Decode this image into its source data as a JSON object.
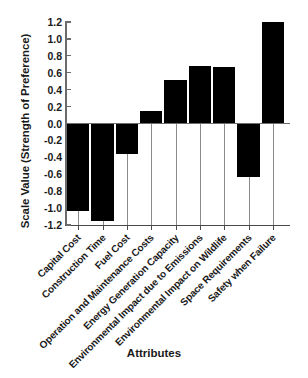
{
  "chart_data": {
    "type": "bar",
    "title": "",
    "xlabel": "Attributes",
    "ylabel": "Scale Value (Strength of Preference)",
    "categories": [
      "Capital Cost",
      "Construction Time",
      "Fuel Cost",
      "Operation and Maintenance Costs",
      "Energy Generation Capacity",
      "Environmental Impact due to Emissions",
      "Environmental Impact on Wildlife",
      "Space Requirements",
      "Safety when Failure"
    ],
    "values": [
      -1.03,
      -1.15,
      -0.36,
      0.15,
      0.51,
      0.68,
      0.67,
      -0.63,
      1.2
    ],
    "ylim": [
      -1.2,
      1.2
    ],
    "yticks": [
      1.2,
      1.0,
      0.8,
      0.6,
      0.4,
      0.2,
      0.0,
      -0.2,
      -0.4,
      -0.6,
      -0.8,
      -1.0,
      -1.2
    ],
    "ytick_labels": [
      "1.2",
      "1.0",
      "0.8",
      "0.6",
      "0.4",
      "0.2",
      "0.0",
      "-0.2",
      "-0.4",
      "-0.6",
      "-0.8",
      "-1.0",
      "-1.2"
    ],
    "grid": false,
    "legend": null,
    "bar_color": "#000000",
    "zero_line_color": "#6d6d6d",
    "axis_color": "#4a4a4a"
  }
}
